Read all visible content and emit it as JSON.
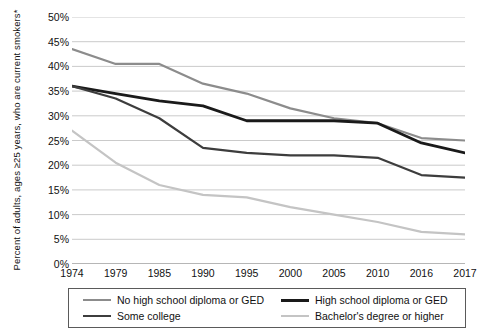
{
  "chart_data": {
    "type": "line",
    "title": "",
    "xlabel": "",
    "ylabel": "Percent of adults, ages ≥25 years, who are current smokers*",
    "x": [
      "1974",
      "1979",
      "1985",
      "1990",
      "1995",
      "2000",
      "2005",
      "2010",
      "2016",
      "2017"
    ],
    "categories": [
      "1974",
      "1979",
      "1985",
      "1990",
      "1995",
      "2000",
      "2005",
      "2010",
      "2016",
      "2017"
    ],
    "ylim": [
      0,
      50
    ],
    "ytick_labels": [
      "50%",
      "45%",
      "40%",
      "35%",
      "30%",
      "25%",
      "20%",
      "15%",
      "10%",
      "5%",
      "0%"
    ],
    "ytick_values": [
      50,
      45,
      40,
      35,
      30,
      25,
      20,
      15,
      10,
      5,
      0
    ],
    "grid": true,
    "legend_position": "bottom",
    "series": [
      {
        "name": "No high school diploma or GED",
        "color": "#8c8c8c",
        "width": 2.2,
        "values": [
          43.5,
          40.5,
          40.5,
          36.5,
          34.5,
          31.5,
          29.5,
          28.5,
          25.5,
          25.0
        ]
      },
      {
        "name": "High school diploma or GED",
        "color": "#1a1a1a",
        "width": 2.8,
        "values": [
          36.0,
          34.5,
          33.0,
          32.0,
          29.0,
          29.0,
          29.0,
          28.5,
          24.5,
          22.5
        ]
      },
      {
        "name": "Some college",
        "color": "#3d3d3d",
        "width": 2.2,
        "values": [
          36.0,
          33.5,
          29.5,
          23.5,
          22.5,
          22.0,
          22.0,
          21.5,
          18.0,
          17.5
        ]
      },
      {
        "name": "Bachelor's degree or higher",
        "color": "#c4c4c4",
        "width": 2.2,
        "values": [
          27.0,
          20.5,
          16.0,
          14.0,
          13.5,
          11.5,
          10.0,
          8.5,
          6.5,
          6.0
        ]
      }
    ]
  },
  "legend": {
    "items": [
      {
        "label": "No high school diploma or GED",
        "color": "#8c8c8c",
        "width": 2.2
      },
      {
        "label": "High school diploma or GED",
        "color": "#1a1a1a",
        "width": 3.0
      },
      {
        "label": "Some college",
        "color": "#3d3d3d",
        "width": 2.6
      },
      {
        "label": "Bachelor's degree or higher",
        "color": "#c4c4c4",
        "width": 2.2
      }
    ]
  },
  "axis": {
    "y_title": "Percent of adults, ages ≥25 years, who are current smokers*"
  }
}
